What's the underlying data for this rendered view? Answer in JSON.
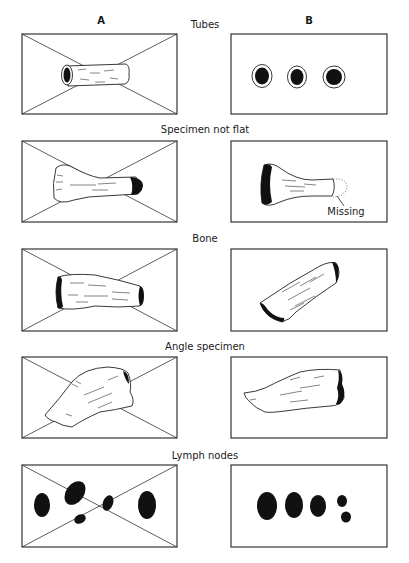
{
  "columns": {
    "a": "A",
    "b": "B"
  },
  "rows": [
    {
      "title": "Tubes"
    },
    {
      "title": "Specimen not flat",
      "annotation_b": "Missing"
    },
    {
      "title": "Bone"
    },
    {
      "title": "Angle specimen"
    },
    {
      "title": "Lymph nodes"
    }
  ],
  "meaning": {
    "column_a": "incorrect placement (crossed out)",
    "column_b": "correct placement"
  }
}
